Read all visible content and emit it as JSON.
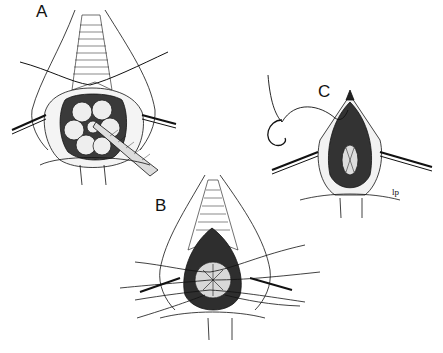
{
  "figure": {
    "panels": [
      {
        "id": "A",
        "label": "A",
        "description": "Exposed anal canal with retractors, suture through apex, forceps grasping tissue"
      },
      {
        "id": "B",
        "label": "B",
        "description": "Multiple sutures placed circumferentially around the canal"
      },
      {
        "id": "C",
        "label": "C",
        "description": "Repair completed with curved needle and suture at apex"
      }
    ],
    "signature": "lp",
    "colors": {
      "ink": "#111111",
      "background": "#ffffff",
      "shade": "#2a2a2a"
    }
  }
}
